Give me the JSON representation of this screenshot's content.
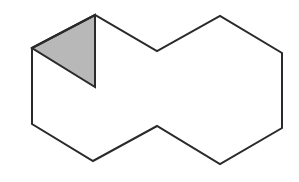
{
  "diagram": {
    "stroke_color": "#2a2a2a",
    "shade_color": "#b8b8b8",
    "background": "#ffffff",
    "outline_points": [
      [
        32,
        48
      ],
      [
        95,
        15
      ],
      [
        157,
        51
      ],
      [
        220,
        16
      ],
      [
        282,
        53
      ],
      [
        282,
        128
      ],
      [
        220,
        164
      ],
      [
        157,
        126
      ],
      [
        93,
        161
      ],
      [
        32,
        124
      ]
    ],
    "shaded_triangle_points": [
      [
        32,
        48
      ],
      [
        95,
        15
      ],
      [
        95,
        87
      ]
    ]
  }
}
